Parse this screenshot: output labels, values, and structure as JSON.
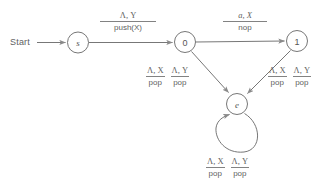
{
  "diagram": {
    "type": "pushdown-automaton-state-diagram",
    "start_label": "Start",
    "nodes": [
      {
        "id": "s",
        "label": "s",
        "x": 78,
        "y": 42,
        "r": 10.5
      },
      {
        "id": "0",
        "label": "0",
        "x": 185,
        "y": 42,
        "r": 10.5
      },
      {
        "id": "1",
        "label": "1",
        "x": 297,
        "y": 41,
        "r": 10.5
      },
      {
        "id": "e",
        "label": "e",
        "x": 237,
        "y": 104,
        "r": 10.5
      }
    ],
    "transitions": [
      {
        "from": "s",
        "to": "0",
        "read": "Λ, Y",
        "action": "push(X)",
        "action_italic_part": "(X)"
      },
      {
        "from": "0",
        "to": "1",
        "read": "a, X",
        "action": "nop"
      },
      {
        "from": "0",
        "to": "e",
        "labels": [
          {
            "read": "Λ, X",
            "action": "pop"
          },
          {
            "read": "Λ, Y",
            "action": "pop"
          }
        ]
      },
      {
        "from": "1",
        "to": "e",
        "labels": [
          {
            "read": "Λ, X",
            "action": "pop"
          },
          {
            "read": "Λ, Y",
            "action": "pop"
          }
        ]
      },
      {
        "from": "e",
        "to": "e",
        "self_loop": true,
        "labels": [
          {
            "read": "Λ, X",
            "action": "pop"
          },
          {
            "read": "Λ, Y",
            "action": "pop"
          }
        ]
      }
    ],
    "colors": {
      "stroke": "#777777",
      "text": "#5f5f5f",
      "background": "#ffffff"
    }
  }
}
